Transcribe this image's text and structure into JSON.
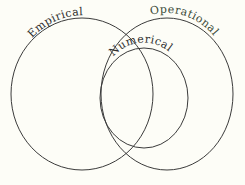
{
  "diagram": {
    "type": "venn",
    "title": "",
    "background_color": "#fdfdf7",
    "stroke_color": "#3b3b3b",
    "width": 245,
    "height": 185,
    "sets": [
      {
        "id": "empirical",
        "label": "Empirical",
        "label_color": "#2e2e2e",
        "shape": "circle",
        "cx": 82,
        "cy": 94,
        "rx": 71,
        "ry": 76,
        "role": "outer-left"
      },
      {
        "id": "operational",
        "label": "Operational",
        "label_color": "#3b4a38",
        "shape": "circle",
        "cx": 167,
        "cy": 94,
        "rx": 66,
        "ry": 76,
        "role": "outer-right"
      },
      {
        "id": "numerical",
        "label": "Numerical",
        "label_color": "#2e2e2e",
        "shape": "circle",
        "cx": 144,
        "cy": 98,
        "rx": 44,
        "ry": 50,
        "role": "inner"
      }
    ]
  }
}
